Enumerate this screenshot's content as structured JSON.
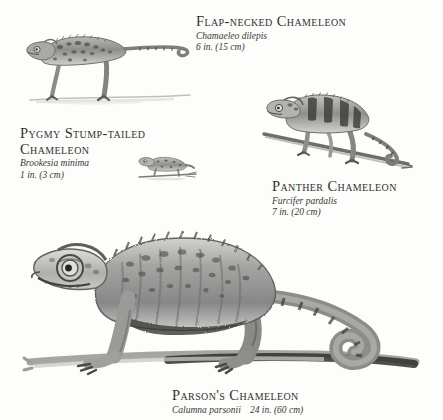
{
  "plate": {
    "title_implicit": "Chameleon size comparison plate",
    "background_color": "#fdfdfb",
    "ink_color": "#33302f"
  },
  "species": [
    {
      "id": "flap-necked",
      "common_name": "Flap-necked Chameleon",
      "scientific_name": "Chamaeleo dilepis",
      "size": "6 in.  (15 cm)",
      "size_inches": 6,
      "size_cm": 15
    },
    {
      "id": "pygmy-stump-tailed",
      "common_name": "Pygmy Stump-tailed Chameleon",
      "scientific_name": "Brookesia minima",
      "size": "1 in.  (3 cm)",
      "size_inches": 1,
      "size_cm": 3
    },
    {
      "id": "panther",
      "common_name": "Panther Chameleon",
      "scientific_name": "Furcifer pardalis",
      "size": "7 in.  (20 cm)",
      "size_inches": 7,
      "size_cm": 20
    },
    {
      "id": "parsons",
      "common_name": "Parson's Chameleon",
      "scientific_name": "Calumna parsonii",
      "size": "24 in.  (60 cm)",
      "size_inches": 24,
      "size_cm": 60
    }
  ]
}
